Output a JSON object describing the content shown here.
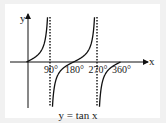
{
  "chart_data": {
    "type": "line",
    "title": "",
    "caption": "y = tan x",
    "xlabel": "x",
    "ylabel": "y",
    "x_unit": "degrees",
    "xlim": [
      -50,
      365
    ],
    "ylim": [
      -6,
      6
    ],
    "grid": false,
    "x_ticks": [
      {
        "value": 90,
        "label": "90°"
      },
      {
        "value": 180,
        "label": "180°"
      },
      {
        "value": 270,
        "label": "270°"
      },
      {
        "value": 360,
        "label": "360°"
      }
    ],
    "asymptotes": [
      90,
      270
    ],
    "series": [
      {
        "name": "y = tan x",
        "function": "tan",
        "x_range": [
          0,
          360
        ],
        "color": "#111111"
      }
    ]
  }
}
